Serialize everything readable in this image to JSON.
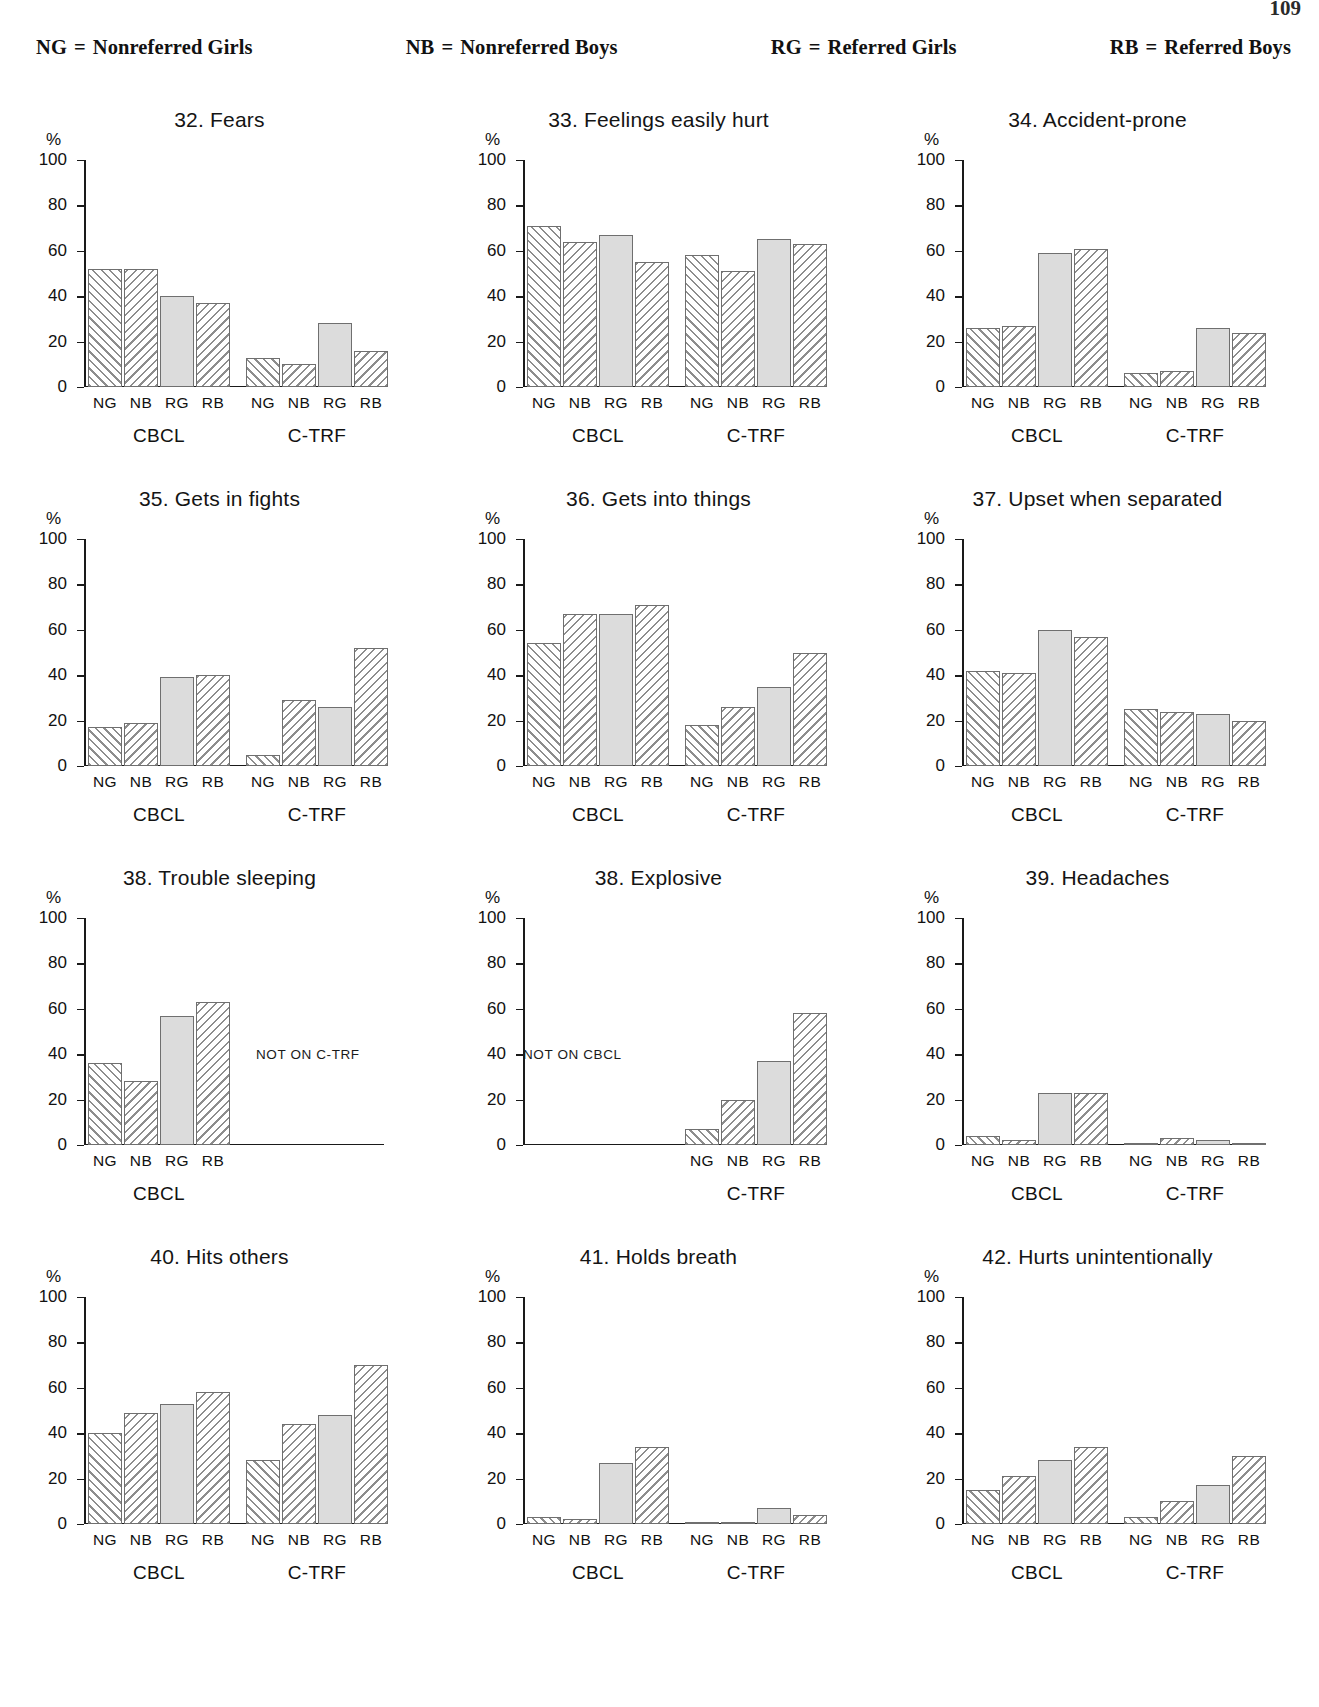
{
  "page_number": "109",
  "legend": [
    {
      "abbr": "NG",
      "eq": "=",
      "label": "Nonreferred Girls"
    },
    {
      "abbr": "NB",
      "eq": "=",
      "label": "Nonreferred Boys"
    },
    {
      "abbr": "RG",
      "eq": "=",
      "label": "Referred Girls"
    },
    {
      "abbr": "RB",
      "eq": "=",
      "label": "Referred Boys"
    }
  ],
  "axis": {
    "percent_symbol": "%",
    "ticks": [
      "100",
      "80",
      "60",
      "40",
      "20",
      "0"
    ],
    "categories": [
      "NG",
      "NB",
      "RG",
      "RB"
    ],
    "groups": [
      "CBCL",
      "C-TRF"
    ]
  },
  "notes": {
    "not_on_ctrf": "NOT ON C-TRF",
    "not_on_cbcl": "NOT ON CBCL"
  },
  "chart_data": [
    {
      "type": "bar",
      "title": "32. Fears",
      "xlabel": "",
      "ylabel": "%",
      "ylim": [
        0,
        100
      ],
      "categories": [
        "NG",
        "NB",
        "RG",
        "RB"
      ],
      "groups": [
        "CBCL",
        "C-TRF"
      ],
      "series": [
        {
          "name": "CBCL",
          "values": [
            52,
            52,
            40,
            37
          ]
        },
        {
          "name": "C-TRF",
          "values": [
            13,
            10,
            28,
            16
          ]
        }
      ]
    },
    {
      "type": "bar",
      "title": "33. Feelings easily hurt",
      "xlabel": "",
      "ylabel": "%",
      "ylim": [
        0,
        100
      ],
      "categories": [
        "NG",
        "NB",
        "RG",
        "RB"
      ],
      "groups": [
        "CBCL",
        "C-TRF"
      ],
      "series": [
        {
          "name": "CBCL",
          "values": [
            71,
            64,
            67,
            55
          ]
        },
        {
          "name": "C-TRF",
          "values": [
            58,
            51,
            65,
            63
          ]
        }
      ]
    },
    {
      "type": "bar",
      "title": "34. Accident-prone",
      "xlabel": "",
      "ylabel": "%",
      "ylim": [
        0,
        100
      ],
      "categories": [
        "NG",
        "NB",
        "RG",
        "RB"
      ],
      "groups": [
        "CBCL",
        "C-TRF"
      ],
      "series": [
        {
          "name": "CBCL",
          "values": [
            26,
            27,
            59,
            61
          ]
        },
        {
          "name": "C-TRF",
          "values": [
            6,
            7,
            26,
            24
          ]
        }
      ]
    },
    {
      "type": "bar",
      "title": "35. Gets in fights",
      "xlabel": "",
      "ylabel": "%",
      "ylim": [
        0,
        100
      ],
      "categories": [
        "NG",
        "NB",
        "RG",
        "RB"
      ],
      "groups": [
        "CBCL",
        "C-TRF"
      ],
      "series": [
        {
          "name": "CBCL",
          "values": [
            17,
            19,
            39,
            40
          ]
        },
        {
          "name": "C-TRF",
          "values": [
            5,
            29,
            26,
            52
          ]
        }
      ]
    },
    {
      "type": "bar",
      "title": "36. Gets into things",
      "xlabel": "",
      "ylabel": "%",
      "ylim": [
        0,
        100
      ],
      "categories": [
        "NG",
        "NB",
        "RG",
        "RB"
      ],
      "groups": [
        "CBCL",
        "C-TRF"
      ],
      "series": [
        {
          "name": "CBCL",
          "values": [
            54,
            67,
            67,
            71
          ]
        },
        {
          "name": "C-TRF",
          "values": [
            18,
            26,
            35,
            50
          ]
        }
      ]
    },
    {
      "type": "bar",
      "title": "37. Upset when separated",
      "xlabel": "",
      "ylabel": "%",
      "ylim": [
        0,
        100
      ],
      "categories": [
        "NG",
        "NB",
        "RG",
        "RB"
      ],
      "groups": [
        "CBCL",
        "C-TRF"
      ],
      "series": [
        {
          "name": "CBCL",
          "values": [
            42,
            41,
            60,
            57
          ]
        },
        {
          "name": "C-TRF",
          "values": [
            25,
            24,
            23,
            20
          ]
        }
      ]
    },
    {
      "type": "bar",
      "title": "38. Trouble sleeping",
      "xlabel": "",
      "ylabel": "%",
      "ylim": [
        0,
        100
      ],
      "categories": [
        "NG",
        "NB",
        "RG",
        "RB"
      ],
      "groups": [
        "CBCL"
      ],
      "note": "NOT ON C-TRF",
      "series": [
        {
          "name": "CBCL",
          "values": [
            36,
            28,
            57,
            63
          ]
        }
      ]
    },
    {
      "type": "bar",
      "title": "38. Explosive",
      "xlabel": "",
      "ylabel": "%",
      "ylim": [
        0,
        100
      ],
      "categories": [
        "NG",
        "NB",
        "RG",
        "RB"
      ],
      "groups": [
        "C-TRF"
      ],
      "note": "NOT ON CBCL",
      "series": [
        {
          "name": "C-TRF",
          "values": [
            7,
            20,
            37,
            58
          ]
        }
      ]
    },
    {
      "type": "bar",
      "title": "39. Headaches",
      "xlabel": "",
      "ylabel": "%",
      "ylim": [
        0,
        100
      ],
      "categories": [
        "NG",
        "NB",
        "RG",
        "RB"
      ],
      "groups": [
        "CBCL",
        "C-TRF"
      ],
      "series": [
        {
          "name": "CBCL",
          "values": [
            4,
            2,
            23,
            23
          ]
        },
        {
          "name": "C-TRF",
          "values": [
            1,
            3,
            2,
            1
          ]
        }
      ]
    },
    {
      "type": "bar",
      "title": "40. Hits others",
      "xlabel": "",
      "ylabel": "%",
      "ylim": [
        0,
        100
      ],
      "categories": [
        "NG",
        "NB",
        "RG",
        "RB"
      ],
      "groups": [
        "CBCL",
        "C-TRF"
      ],
      "series": [
        {
          "name": "CBCL",
          "values": [
            40,
            49,
            53,
            58
          ]
        },
        {
          "name": "C-TRF",
          "values": [
            28,
            44,
            48,
            70
          ]
        }
      ]
    },
    {
      "type": "bar",
      "title": "41. Holds breath",
      "xlabel": "",
      "ylabel": "%",
      "ylim": [
        0,
        100
      ],
      "categories": [
        "NG",
        "NB",
        "RG",
        "RB"
      ],
      "groups": [
        "CBCL",
        "C-TRF"
      ],
      "series": [
        {
          "name": "CBCL",
          "values": [
            3,
            2,
            27,
            34
          ]
        },
        {
          "name": "C-TRF",
          "values": [
            1,
            1,
            7,
            4
          ]
        }
      ]
    },
    {
      "type": "bar",
      "title": "42. Hurts unintentionally",
      "xlabel": "",
      "ylabel": "%",
      "ylim": [
        0,
        100
      ],
      "categories": [
        "NG",
        "NB",
        "RG",
        "RB"
      ],
      "groups": [
        "CBCL",
        "C-TRF"
      ],
      "series": [
        {
          "name": "CBCL",
          "values": [
            15,
            21,
            28,
            34
          ]
        },
        {
          "name": "C-TRF",
          "values": [
            3,
            10,
            17,
            30
          ]
        }
      ]
    }
  ]
}
